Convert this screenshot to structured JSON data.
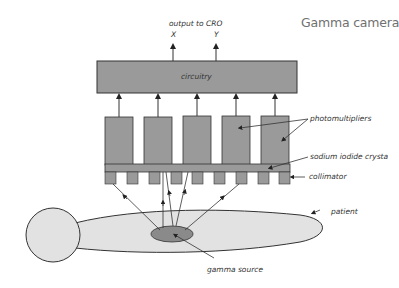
{
  "title": "Gamma camera",
  "labels": {
    "output": "output to CRO",
    "x": "X",
    "y": "Y",
    "circuitry": "circuitry",
    "photomultipliers": "photomultipliers",
    "crystal": "sodium iodide crystal",
    "collimator": "collimator",
    "patient": "patient",
    "source": "gamma source"
  },
  "colors": {
    "component_fill": "#9a9a9a",
    "patient_fill": "#e2e2e2",
    "source_fill": "#8a8a8a",
    "stroke": "#333333"
  }
}
